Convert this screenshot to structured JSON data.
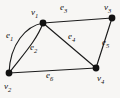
{
  "figure": {
    "kind": "undirected-multigraph-diagram",
    "background_color": "#f7f6f4",
    "ink_color": "#1b1b1b",
    "width": 120,
    "height": 98
  },
  "vertices": [
    {
      "id": "v1",
      "label": "v",
      "sub": "1",
      "x": 43,
      "y": 23,
      "label_x": 31,
      "label_y": 8
    },
    {
      "id": "v2",
      "label": "v",
      "sub": "2",
      "x": 9,
      "y": 73,
      "label_x": 4,
      "label_y": 82
    },
    {
      "id": "v3",
      "label": "v",
      "sub": "3",
      "x": 112,
      "y": 18,
      "label_x": 104,
      "label_y": 3
    },
    {
      "id": "v4",
      "label": "v",
      "sub": "4",
      "x": 96,
      "y": 68,
      "label_x": 97,
      "label_y": 74
    }
  ],
  "edges": [
    {
      "id": "e1",
      "label": "e",
      "sub": "1",
      "from": "v1",
      "to": "v2",
      "shape": "curve-left",
      "label_x": 6,
      "label_y": 31
    },
    {
      "id": "e2",
      "label": "e",
      "sub": "2",
      "from": "v1",
      "to": "v2",
      "shape": "curve-right",
      "label_x": 30,
      "label_y": 43
    },
    {
      "id": "e3",
      "label": "e",
      "sub": "3",
      "from": "v1",
      "to": "v3",
      "shape": "straight",
      "label_x": 60,
      "label_y": 3
    },
    {
      "id": "e4",
      "label": "e",
      "sub": "4",
      "from": "v1",
      "to": "v4",
      "shape": "straight",
      "label_x": 68,
      "label_y": 32
    },
    {
      "id": "e5",
      "label": "e",
      "sub": "5",
      "from": "v3",
      "to": "v4",
      "shape": "straight",
      "label_x": 102,
      "label_y": 38
    },
    {
      "id": "e6",
      "label": "e",
      "sub": "6",
      "from": "v2",
      "to": "v4",
      "shape": "straight",
      "label_x": 46,
      "label_y": 71
    }
  ],
  "paths": {
    "e1": "M 43 23 C 26 26, 10 44, 9 73",
    "e2": "M 43 23 C 37 40, 22 56, 9 73",
    "e3": "M 43 23 L 112 18",
    "e4": "M 43 23 L 96 68",
    "e5": "M 112 18 L 96 68",
    "e6": "M 9 73 L 96 68"
  }
}
